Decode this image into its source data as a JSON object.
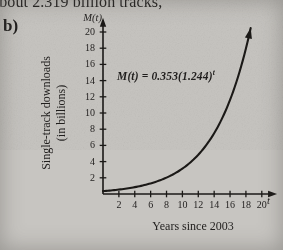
{
  "page": {
    "background_color": "#c7c5c1",
    "ink_color": "#201e1d",
    "truncated_text_above": "about 2.319 billion tracks,",
    "part_label": "b)"
  },
  "chart_data": {
    "type": "line",
    "title": "",
    "subtitle": "",
    "equation": "M(t) = 0.353(1.244)^t",
    "equation_base_text": "M(t) = 0.353(1.244)",
    "equation_exponent": "t",
    "coefficient": 0.353,
    "base": 1.244,
    "xlabel": "Years since 2003",
    "x_axis_symbol": "t",
    "ylabel_line1": "Single-track downloads",
    "ylabel_line2": "(in billions)",
    "y_axis_symbol": "M(t)",
    "xticks": [
      2,
      4,
      6,
      8,
      10,
      12,
      14,
      16,
      18,
      20
    ],
    "yticks": [
      20,
      18,
      16,
      14,
      12,
      10,
      8,
      6,
      4,
      2
    ],
    "xlim": [
      0,
      21.8
    ],
    "ylim": [
      0,
      21.5
    ],
    "grid": false,
    "legend": null,
    "curve_t_max": 18.72,
    "x": [
      0,
      1,
      2,
      3,
      4,
      5,
      6,
      7,
      8,
      9,
      10,
      11,
      12,
      13,
      14,
      15,
      16,
      17,
      18
    ],
    "y": [
      0.353,
      0.439,
      0.546,
      0.68,
      0.845,
      1.052,
      1.308,
      1.627,
      2.024,
      2.518,
      3.133,
      3.897,
      4.847,
      6.029,
      7.5,
      9.33,
      11.607,
      14.439,
      17.962
    ],
    "line_color": "#1b1917",
    "axis_color": "#1b1917"
  }
}
